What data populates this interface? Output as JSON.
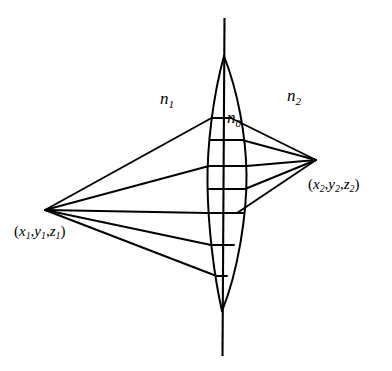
{
  "figure": {
    "stroke_color": "#000000",
    "background_color": "#ffffff",
    "labels": {
      "medium_left": {
        "symbol": "n",
        "subscript": "1",
        "text": "n1"
      },
      "medium_lens": {
        "symbol": "n",
        "subscript": "0",
        "text": "n0"
      },
      "medium_right": {
        "symbol": "n",
        "subscript": "2",
        "text": "n2"
      },
      "object_point": {
        "open": "(",
        "x": "x",
        "x_sub": "1",
        "sep1": ",",
        "y": "y",
        "y_sub": "1",
        "sep2": ",",
        "z": "z",
        "z_sub": "1",
        "close": ")",
        "text": "(x1,y1,z1)"
      },
      "image_point": {
        "open": "(",
        "x": "x",
        "x_sub": "2",
        "sep1": ",",
        "y": "y",
        "y_sub": "2",
        "sep2": ",",
        "z": "z",
        "z_sub": "2",
        "close": ")",
        "text": "(x2,y2,z2)"
      }
    }
  },
  "geometry": {
    "optical_axis": {
      "x_top": 224,
      "y_top": 18,
      "x_bottom": 222,
      "y_bottom": 356
    },
    "object_vertex": {
      "x": 45,
      "y": 210
    },
    "image_vertex": {
      "x": 316,
      "y": 160
    },
    "lens": {
      "top_tip": {
        "x": 224,
        "y": 56
      },
      "bottom_tip": {
        "x": 222,
        "y": 311
      },
      "left_surface_extreme_x": 207,
      "right_surface_extreme_x": 247,
      "waist_y": 180
    },
    "chord_y_values": [
      118,
      140,
      166,
      189,
      213,
      245,
      276
    ],
    "ray_count_left": 5,
    "ray_count_right": 5
  }
}
